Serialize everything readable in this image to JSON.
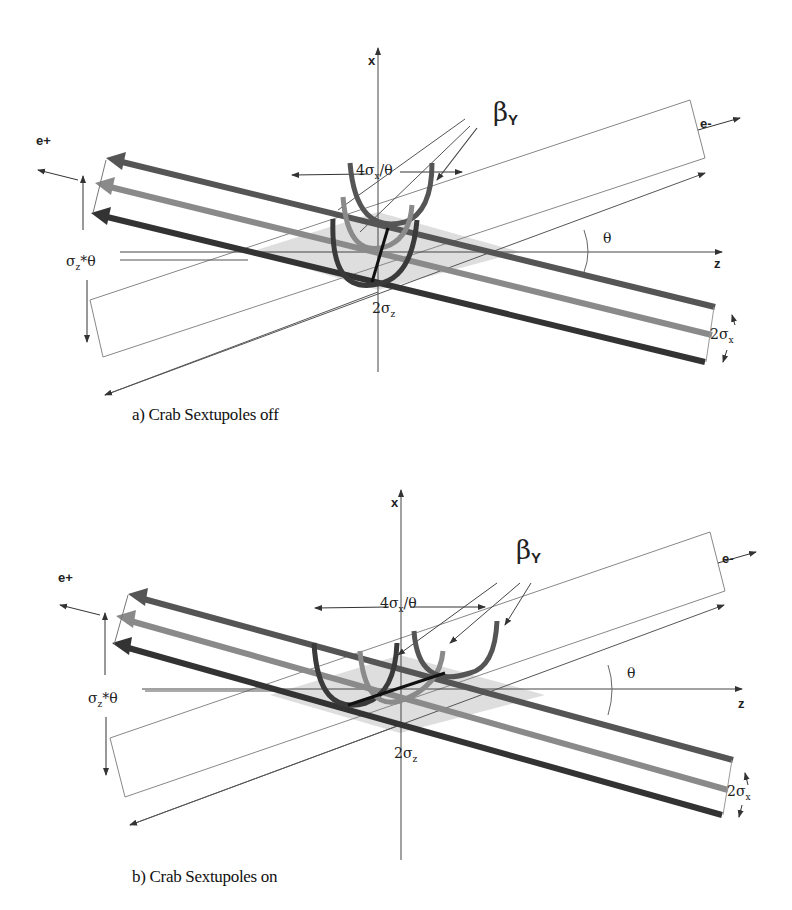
{
  "figure": {
    "panels": [
      {
        "id": "a",
        "caption": "a)  Crab Sextupoles off",
        "labels": {
          "x_axis": "x",
          "z_axis": "z",
          "positron": "e+",
          "electron": "e-",
          "beta": "β",
          "beta_sub": "Y",
          "waist_spread": "4σ",
          "waist_spread_sub": "x",
          "waist_spread_tail": "/θ",
          "sigma_z_theta": "σ",
          "sigma_z_theta_sub": "z",
          "sigma_z_theta_tail": "*θ",
          "two_sigma_z": "2σ",
          "two_sigma_z_sub": "z",
          "two_sigma_x": "2σ",
          "two_sigma_x_sub": "x",
          "theta": "θ"
        }
      },
      {
        "id": "b",
        "caption": "b)  Crab Sextupoles on",
        "labels": {
          "x_axis": "x",
          "z_axis": "z",
          "positron": "e+",
          "electron": "e-",
          "beta": "β",
          "beta_sub": "Y",
          "waist_spread": "4σ",
          "waist_spread_sub": "x",
          "waist_spread_tail": "/θ",
          "sigma_z_theta": "σ",
          "sigma_z_theta_sub": "z",
          "sigma_z_theta_tail": "*θ",
          "two_sigma_z": "2σ",
          "two_sigma_z_sub": "z",
          "two_sigma_x": "2σ",
          "two_sigma_x_sub": "x",
          "theta": "θ"
        }
      }
    ],
    "colors": {
      "beam_top": "#555555",
      "beam_mid": "#8a8a8a",
      "beam_bottom": "#333333",
      "overlap_fill": "#d8d8d8",
      "axis": "#444444",
      "thin_line": "#777777"
    }
  }
}
